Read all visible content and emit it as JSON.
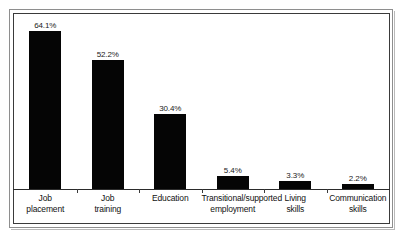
{
  "chart_data": {
    "type": "bar",
    "title": "",
    "subtitle": "",
    "xlabel": "",
    "ylabel": "",
    "ylim": [
      0,
      70
    ],
    "grid": false,
    "legend": null,
    "orientation": "vertical",
    "bar_color": "#050505",
    "background_color": "#ffffff",
    "value_suffix": "%",
    "categories": [
      "Job placement",
      "Job training",
      "Education",
      "Transitional/supported employment",
      "Living skills",
      "Communication skills"
    ],
    "values": [
      64.1,
      52.2,
      30.4,
      5.4,
      3.3,
      2.2
    ],
    "value_labels": [
      "64.1%",
      "52.2%",
      "30.4%",
      "5.4%",
      "3.3%",
      "2.2%"
    ],
    "points": [
      {
        "category": "Job placement",
        "line1": "Job",
        "line2": "placement",
        "value": 64.1,
        "label": "64.1%"
      },
      {
        "category": "Job training",
        "line1": "Job",
        "line2": "training",
        "value": 52.2,
        "label": "52.2%"
      },
      {
        "category": "Education",
        "line1": "Education",
        "line2": "",
        "value": 30.4,
        "label": "30.4%"
      },
      {
        "category": "Transitional/supported employment",
        "line1": "Transitional/supported",
        "line2": "employment",
        "value": 5.4,
        "label": "5.4%"
      },
      {
        "category": "Living skills",
        "line1": "Living",
        "line2": "skills",
        "value": 3.3,
        "label": "3.3%"
      },
      {
        "category": "Communication skills",
        "line1": "Communication",
        "line2": "skills",
        "value": 2.2,
        "label": "2.2%"
      }
    ]
  }
}
